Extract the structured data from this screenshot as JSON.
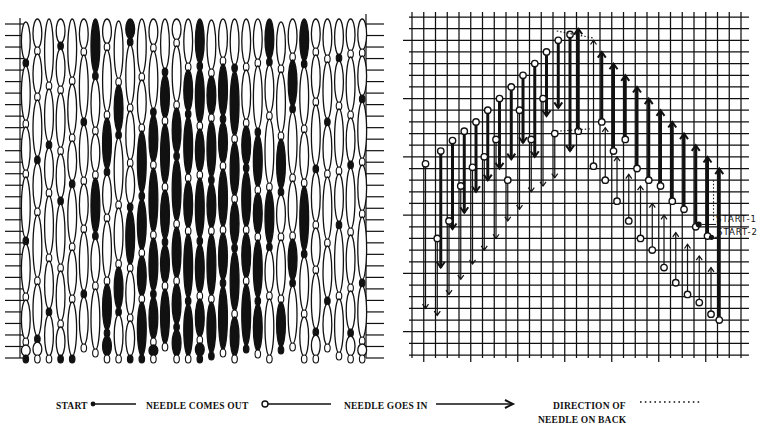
{
  "figure": {
    "left_panel": {
      "name": "finished-stitch-pattern",
      "columns": 30,
      "x0": 20,
      "x1": 368,
      "y0": 18,
      "y1": 358,
      "tick_left_x": 20,
      "tick_right_x": 366,
      "tick_count": 30
    },
    "right_panel": {
      "name": "stitch-chart-grid",
      "x0": 412,
      "x1": 741,
      "y0": 17,
      "y1": 355,
      "cols": 28,
      "rows": 29
    },
    "annotations": {
      "start1": "START-1",
      "start2": "START-2"
    }
  },
  "legend": {
    "start": "START",
    "needle_out": "NEEDLE COMES OUT",
    "needle_in": "NEEDLE GOES IN",
    "direction_line1": "DIRECTION OF",
    "direction_line2": "NEEDLE ON BACK"
  },
  "stitch_chart": {
    "descending_stitches": [
      {
        "col": 1,
        "top": 12.6,
        "bottom": 25.0
      },
      {
        "col": 2,
        "top": 11.5,
        "bottom": 21.5
      },
      {
        "col": 2,
        "top": 19.0,
        "bottom": 25.6
      },
      {
        "col": 3,
        "top": 10.6,
        "bottom": 18.2
      },
      {
        "col": 3,
        "top": 17.5,
        "bottom": 23.8
      },
      {
        "col": 4,
        "top": 9.8,
        "bottom": 16.8
      },
      {
        "col": 4,
        "top": 14.5,
        "bottom": 22.5
      },
      {
        "col": 5,
        "top": 9.0,
        "bottom": 15.0
      },
      {
        "col": 5,
        "top": 12.9,
        "bottom": 21.2
      },
      {
        "col": 6,
        "top": 8.0,
        "bottom": 14.0
      },
      {
        "col": 6,
        "top": 12.0,
        "bottom": 20.0
      },
      {
        "col": 7,
        "top": 7.0,
        "bottom": 13.0
      },
      {
        "col": 7,
        "top": 10.5,
        "bottom": 19.0
      },
      {
        "col": 8,
        "top": 6.0,
        "bottom": 12.2
      },
      {
        "col": 8,
        "top": 14.0,
        "bottom": 17.5
      },
      {
        "col": 9,
        "top": 5.0,
        "bottom": 10.8
      },
      {
        "col": 9,
        "top": 8.0,
        "bottom": 16.5
      },
      {
        "col": 10,
        "top": 4.0,
        "bottom": 12.0
      },
      {
        "col": 10,
        "top": 10.5,
        "bottom": 15.0
      },
      {
        "col": 11,
        "top": 3.0,
        "bottom": 8.5
      },
      {
        "col": 11,
        "top": 7.0,
        "bottom": 14.5
      },
      {
        "col": 12,
        "top": 2.0,
        "bottom": 7.8
      },
      {
        "col": 12,
        "top": 10.0,
        "bottom": 13.8
      },
      {
        "col": 13,
        "top": 1.5,
        "bottom": 11.5
      }
    ],
    "ascending_stitches": [
      {
        "col": 14,
        "top": 1.0,
        "bottom": 9.8
      },
      {
        "col": 15,
        "top": 2.0,
        "bottom": 12.8
      },
      {
        "col": 16,
        "top": 3.0,
        "bottom": 9.0
      },
      {
        "col": 16,
        "top": 9.5,
        "bottom": 14.0
      },
      {
        "col": 17,
        "top": 4.0,
        "bottom": 11.5
      },
      {
        "col": 17,
        "top": 12.0,
        "bottom": 15.8
      },
      {
        "col": 18,
        "top": 5.0,
        "bottom": 10.5
      },
      {
        "col": 18,
        "top": 13.5,
        "bottom": 17.5
      },
      {
        "col": 19,
        "top": 6.0,
        "bottom": 13.0
      },
      {
        "col": 19,
        "top": 14.5,
        "bottom": 19.0
      },
      {
        "col": 20,
        "top": 7.0,
        "bottom": 14.0
      },
      {
        "col": 20,
        "top": 16.0,
        "bottom": 20.0
      },
      {
        "col": 21,
        "top": 8.0,
        "bottom": 14.5
      },
      {
        "col": 21,
        "top": 17.0,
        "bottom": 21.5
      },
      {
        "col": 22,
        "top": 9.0,
        "bottom": 15.8
      },
      {
        "col": 22,
        "top": 18.5,
        "bottom": 22.8
      },
      {
        "col": 23,
        "top": 10.0,
        "bottom": 16.5
      },
      {
        "col": 23,
        "top": 19.5,
        "bottom": 23.8
      },
      {
        "col": 24,
        "top": 11.0,
        "bottom": 18.0
      },
      {
        "col": 24,
        "top": 20.5,
        "bottom": 24.5
      },
      {
        "col": 25,
        "top": 12.0,
        "bottom": 18.8
      },
      {
        "col": 25,
        "top": 21.5,
        "bottom": 25.5
      },
      {
        "col": 26,
        "top": 13.0,
        "bottom": 26.0
      }
    ]
  },
  "styles": {
    "ink": "#111111",
    "paper": "#ffffff"
  }
}
